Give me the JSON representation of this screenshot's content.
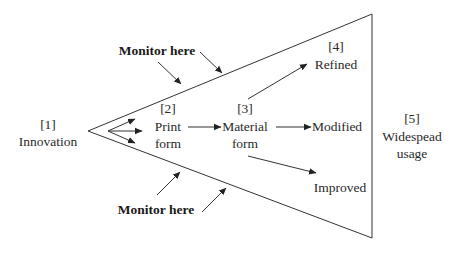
{
  "diagram": {
    "stages": [
      {
        "num": "[1]",
        "line1": "Innovation",
        "line2": ""
      },
      {
        "num": "[2]",
        "line1": "Print",
        "line2": "form"
      },
      {
        "num": "[3]",
        "line1": "Material",
        "line2": "form"
      },
      {
        "num": "[4]",
        "line1": "Refined",
        "line2": ""
      },
      {
        "num": "[5]",
        "line1": "Widespead",
        "line2": "usage"
      }
    ],
    "outcomes": {
      "refined": "Refined",
      "modified": "Modified",
      "improved": "Improved"
    },
    "monitor_top": "Monitor here",
    "monitor_bottom": "Monitor here"
  }
}
